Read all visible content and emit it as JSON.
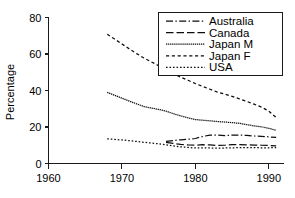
{
  "chart_data": {
    "type": "line",
    "title": "",
    "xlabel": "",
    "ylabel": "Percentage",
    "xlim": [
      1960,
      1992
    ],
    "ylim": [
      0,
      80
    ],
    "xticks": [
      1960,
      1970,
      1980,
      1990
    ],
    "yticks": [
      0,
      20,
      40,
      60,
      80
    ],
    "xtick_labels": [
      "1960",
      "1970",
      "1980",
      "1990"
    ],
    "ytick_labels": [
      "0",
      "20",
      "40",
      "60",
      "80"
    ],
    "grid": false,
    "legend_position": "top-right",
    "series": [
      {
        "name": "Australia",
        "dash": "dashdot",
        "x": [
          1976,
          1977,
          1978,
          1979,
          1980,
          1981,
          1982,
          1983,
          1984,
          1985,
          1986,
          1987,
          1988,
          1989,
          1990,
          1991
        ],
        "values": [
          12.1,
          12.6,
          13.0,
          13.3,
          13.7,
          14.8,
          15.6,
          15.6,
          15.3,
          15.5,
          15.6,
          15.4,
          15.1,
          14.9,
          14.6,
          14.3
        ]
      },
      {
        "name": "Canada",
        "dash": "longdash",
        "x": [
          1976,
          1977,
          1978,
          1979,
          1980,
          1981,
          1982,
          1983,
          1984,
          1985,
          1986,
          1987,
          1988,
          1989,
          1990,
          1991
        ],
        "values": [
          11.6,
          11.0,
          10.5,
          10.2,
          10.0,
          10.3,
          10.2,
          9.9,
          10.0,
          10.3,
          10.3,
          10.2,
          10.1,
          10.0,
          9.9,
          9.7
        ]
      },
      {
        "name": "Japan M",
        "dash": "finedot",
        "x": [
          1968,
          1969,
          1970,
          1971,
          1972,
          1973,
          1974,
          1975,
          1976,
          1977,
          1978,
          1979,
          1980,
          1981,
          1982,
          1983,
          1984,
          1985,
          1986,
          1987,
          1988,
          1989,
          1990,
          1991
        ],
        "values": [
          39.0,
          37.4,
          35.8,
          34.2,
          32.7,
          31.2,
          30.4,
          29.6,
          28.7,
          27.3,
          26.1,
          25.0,
          24.1,
          23.7,
          23.4,
          23.0,
          22.7,
          22.4,
          22.0,
          21.3,
          20.6,
          20.1,
          19.3,
          18.2
        ]
      },
      {
        "name": "Japan F",
        "dash": "shortdash",
        "x": [
          1968,
          1969,
          1970,
          1971,
          1972,
          1973,
          1974,
          1975,
          1976,
          1977,
          1978,
          1979,
          1980,
          1981,
          1982,
          1983,
          1984,
          1985,
          1986,
          1987,
          1988,
          1989,
          1990,
          1991
        ],
        "values": [
          70.8,
          68.2,
          65.5,
          62.8,
          60.2,
          57.8,
          55.7,
          53.6,
          51.4,
          49.2,
          47.3,
          45.6,
          43.8,
          42.2,
          40.7,
          39.1,
          38.0,
          36.8,
          35.4,
          34.0,
          32.5,
          30.9,
          28.7,
          25.2
        ]
      },
      {
        "name": "USA",
        "dash": "dot",
        "x": [
          1968,
          1969,
          1970,
          1971,
          1972,
          1973,
          1974,
          1975,
          1976,
          1977,
          1978,
          1979,
          1980,
          1981,
          1982,
          1983,
          1984,
          1985,
          1986,
          1987,
          1988,
          1989,
          1990,
          1991
        ],
        "values": [
          13.5,
          13.2,
          12.9,
          12.5,
          12.1,
          11.6,
          11.2,
          10.8,
          10.3,
          9.6,
          9.1,
          8.8,
          8.5,
          8.5,
          8.5,
          8.4,
          8.5,
          8.6,
          8.7,
          8.7,
          8.7,
          8.6,
          8.6,
          8.7
        ]
      }
    ]
  },
  "axes": {
    "y_title": "Percentage"
  },
  "legend": {
    "items": [
      {
        "label": "Australia"
      },
      {
        "label": "Canada"
      },
      {
        "label": "Japan M"
      },
      {
        "label": "Japan F"
      },
      {
        "label": "USA"
      }
    ]
  }
}
